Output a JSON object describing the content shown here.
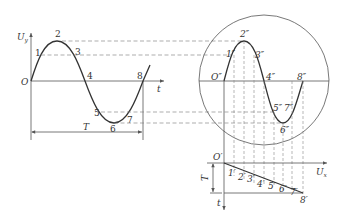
{
  "diagram": {
    "title": "",
    "left_graph": {
      "y_axis_label": "U",
      "y_axis_sub": "y",
      "x_axis_label": "t",
      "origin_label": "O",
      "period_label": "T",
      "points": [
        "1",
        "2",
        "3",
        "4",
        "5",
        "6",
        "7",
        "8"
      ]
    },
    "screen": {
      "origin_label": "O″",
      "points": [
        "1″",
        "2″",
        "3″",
        "4″",
        "5″",
        "6″",
        "7″",
        "8″"
      ]
    },
    "sweep": {
      "origin_label": "O′",
      "x_axis_label": "U",
      "x_axis_sub": "x",
      "y_axis_label": "t",
      "period_label": "T",
      "points": [
        "1′",
        "2′",
        "3′",
        "4′",
        "5′",
        "6′",
        "7′",
        "8′"
      ]
    }
  }
}
